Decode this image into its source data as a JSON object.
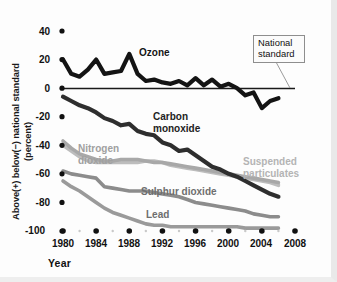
{
  "figure": {
    "xaxis_title": "Year",
    "yaxis_title_line1": "Above(+) below(−) national standard",
    "yaxis_title_line2": "(percent)",
    "callout": {
      "line1": "National",
      "line2": "standard"
    },
    "labels": {
      "ozone": "Ozone",
      "carbon_monoxide_line1": "Carbon",
      "carbon_monoxide_line2": "monoxide",
      "nitrogen_dioxide_line1": "Nitrogen",
      "nitrogen_dioxide_line2": "dioxide",
      "suspended_particulates_line1": "Suspended",
      "suspended_particulates_line2": "particulates",
      "sulphur_dioxide": "Sulphur dioxide",
      "lead": "Lead"
    }
  },
  "colors": {
    "ozone": "#141414",
    "carbon_monoxide": "#2e2e2e",
    "nitrogen_dioxide": "#a8a8a8",
    "suspended_particulates": "#bdbdbd",
    "sulphur_dioxide": "#8c8c8c",
    "lead": "#9a9a9a",
    "zero_line": "#1a1a1a",
    "tick": "#111111",
    "background": "#fdfdfd"
  },
  "chart_data": {
    "type": "line",
    "title": "",
    "xlabel": "Year",
    "ylabel": "Above(+) below(−) national standard (percent)",
    "xlim": [
      1980,
      2008
    ],
    "ylim": [
      -100,
      40
    ],
    "xticks": [
      1980,
      1984,
      1988,
      1992,
      1996,
      2000,
      2004,
      2008
    ],
    "yticks": [
      40,
      20,
      0,
      -20,
      -40,
      -60,
      -80,
      -100
    ],
    "minor_xticks": [
      1982,
      1986,
      1990,
      1994,
      1998,
      2002,
      2006
    ],
    "grid": false,
    "legend": "inline-labels",
    "annotations": [
      {
        "text": "National standard",
        "points_to_y": 0,
        "points_to_x": 2005
      }
    ],
    "x": [
      1980,
      1981,
      1982,
      1983,
      1984,
      1985,
      1986,
      1987,
      1988,
      1989,
      1990,
      1991,
      1992,
      1993,
      1994,
      1995,
      1996,
      1997,
      1998,
      1999,
      2000,
      2001,
      2002,
      2003,
      2004,
      2005,
      2006
    ],
    "series": [
      {
        "name": "Ozone",
        "color": "#141414",
        "values": [
          20,
          10,
          8,
          13,
          20,
          10,
          11,
          12,
          24,
          10,
          5,
          6,
          4,
          3,
          5,
          2,
          7,
          2,
          6,
          1,
          3,
          0,
          -5,
          -3,
          -14,
          -9,
          -7
        ]
      },
      {
        "name": "Carbon monoxide",
        "color": "#2e2e2e",
        "values": [
          -6,
          -9,
          -12,
          -14,
          -17,
          -21,
          -23,
          -26,
          -25,
          -30,
          -32,
          -33,
          -38,
          -40,
          -44,
          -43,
          -47,
          -51,
          -55,
          -57,
          -60,
          -62,
          -65,
          -68,
          -71,
          -74,
          -76
        ]
      },
      {
        "name": "Nitrogen dioxide",
        "color": "#a8a8a8",
        "values": [
          -37,
          -42,
          -46,
          -48,
          -50,
          -51,
          -51,
          -50,
          -50,
          -50,
          -51,
          -52,
          -52,
          -53,
          -54,
          -55,
          -56,
          -57,
          -58,
          -59,
          -60,
          -61,
          -62,
          -63,
          -64,
          -65,
          -66
        ]
      },
      {
        "name": "Suspended particulates",
        "color": "#bdbdbd",
        "values": [
          -40,
          -44,
          -48,
          -51,
          -52,
          -52,
          -52,
          -52,
          -52,
          -52,
          -51,
          -51,
          -52,
          -54,
          -55,
          -56,
          -57,
          -58,
          -59,
          -60,
          -61,
          -62,
          -63,
          -64,
          -65,
          -66,
          -68
        ]
      },
      {
        "name": "Sulphur dioxide",
        "color": "#8c8c8c",
        "values": [
          -58,
          -60,
          -61,
          -62,
          -63,
          -69,
          -70,
          -71,
          -72,
          -72,
          -72,
          -73,
          -74,
          -75,
          -76,
          -78,
          -80,
          -81,
          -82,
          -83,
          -84,
          -85,
          -86,
          -88,
          -89,
          -90,
          -90
        ]
      },
      {
        "name": "Lead",
        "color": "#9a9a9a",
        "values": [
          -65,
          -69,
          -72,
          -76,
          -80,
          -84,
          -87,
          -89,
          -91,
          -93,
          -95,
          -96,
          -96,
          -97,
          -97,
          -97,
          -97,
          -97,
          -97,
          -97,
          -97,
          -97,
          -98,
          -98,
          -98,
          -98,
          -98
        ]
      }
    ]
  }
}
